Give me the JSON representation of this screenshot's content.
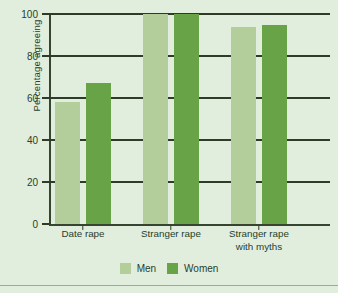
{
  "chart_data": {
    "type": "bar",
    "title": "",
    "subtitle": "",
    "xlabel": "",
    "ylabel": "Percentage agreeing",
    "categories": [
      "Date rape",
      "Stranger rape",
      "Stranger rape\nwith myths"
    ],
    "series": [
      {
        "name": "Men",
        "values": [
          58,
          100,
          94
        ],
        "color": "#b4ce9b"
      },
      {
        "name": "Women",
        "values": [
          67,
          100,
          95
        ],
        "color": "#69a347"
      }
    ],
    "ylim": [
      0,
      100
    ],
    "yticks": [
      0,
      20,
      40,
      60,
      80,
      100
    ],
    "ytick_labels": [
      "0",
      "20",
      "40",
      "60",
      "80",
      "100"
    ],
    "grid": true,
    "legend_position": "bottom",
    "background_color": "#e1eedd",
    "axis_color": "#2d3b27",
    "text_color": "#28402a"
  }
}
